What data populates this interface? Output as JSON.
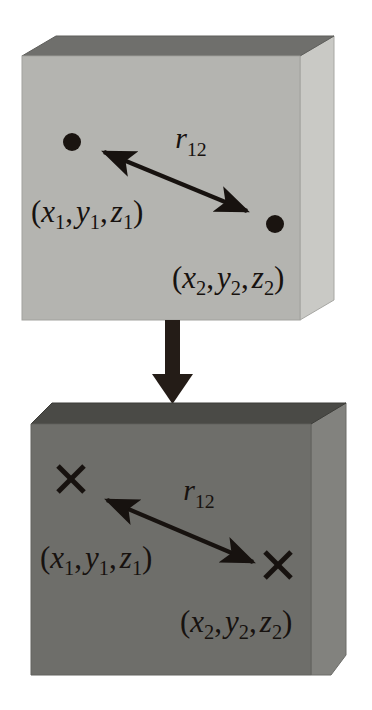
{
  "figure": {
    "background_color": "#ffffff",
    "ink_color": "#17120f",
    "panels": [
      {
        "id": "top-slab",
        "name": "point-particle-slab",
        "marker_type": "filled-dot",
        "colors": {
          "front": "#b4b4b0",
          "top": "#6f6f6c",
          "side": "#c9c9c5",
          "edge": "#8d8d89"
        },
        "labels": {
          "distance": {
            "symbol": "r",
            "subscript": "12",
            "text": "r12"
          },
          "point1": {
            "open": "(",
            "x": "x",
            "x_sub": "1",
            "y": "y",
            "y_sub": "1",
            "z": "z",
            "z_sub": "1",
            "close": ")",
            "text": "(x1, y1, z1)"
          },
          "point2": {
            "open": "(",
            "x": "x",
            "x_sub": "2",
            "y": "y",
            "y_sub": "2",
            "z": "z",
            "z_sub": "2",
            "close": ")",
            "text": "(x2, y2, z2)"
          }
        }
      },
      {
        "id": "bottom-slab",
        "name": "cross-marker-slab",
        "marker_type": "cross",
        "colors": {
          "front": "#6e6e6a",
          "top": "#4a4a46",
          "side": "#82827e",
          "edge": "#585854"
        },
        "labels": {
          "distance": {
            "symbol": "r",
            "subscript": "12",
            "text": "r12"
          },
          "point1": {
            "open": "(",
            "x": "x",
            "x_sub": "1",
            "y": "y",
            "y_sub": "1",
            "z": "z",
            "z_sub": "1",
            "close": ")",
            "text": "(x1, y1, z1)"
          },
          "point2": {
            "open": "(",
            "x": "x",
            "x_sub": "2",
            "y": "y",
            "y_sub": "2",
            "z": "z",
            "z_sub": "2",
            "close": ")",
            "text": "(x2, y2, z2)"
          }
        }
      }
    ],
    "transition_arrow": {
      "name": "downward-transition-arrow",
      "direction": "down",
      "color": "#241c17"
    },
    "separators": {
      "comma": ","
    }
  }
}
